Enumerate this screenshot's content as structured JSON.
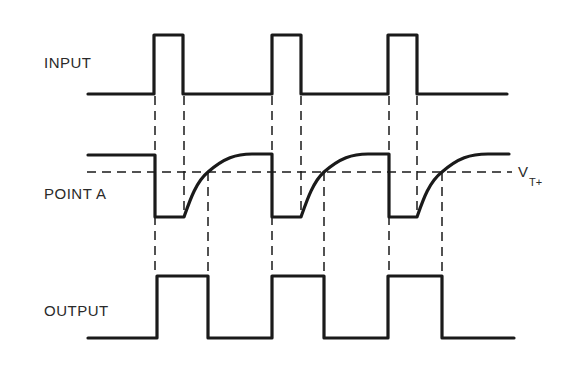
{
  "diagram": {
    "type": "timing-diagram",
    "signals": [
      {
        "name": "INPUT",
        "label": "INPUT",
        "waveform": "pulse train: low baseline with three short high pulses"
      },
      {
        "name": "POINT A",
        "label": "POINT A",
        "waveform": "drops low on input rising edge, recovers exponentially (RC) after input falling edge"
      },
      {
        "name": "OUTPUT",
        "label": "OUTPUT",
        "waveform": "high from input rising edge until point A recrosses V_T+"
      }
    ],
    "threshold": {
      "label_main": "V",
      "label_sub": "T+",
      "style": "dashed horizontal line"
    },
    "edges": {
      "input_rise_x": [
        154,
        272,
        388
      ],
      "input_fall_x": [
        183,
        301,
        417
      ],
      "threshold_cross_x": [
        208,
        324,
        442
      ]
    }
  }
}
